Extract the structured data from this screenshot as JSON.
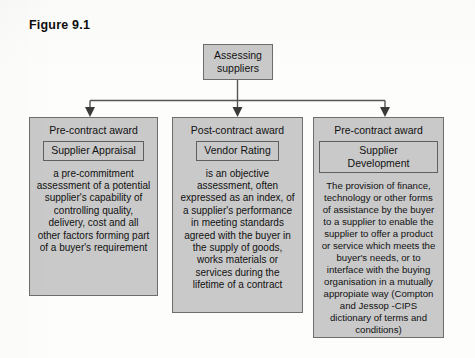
{
  "figure": {
    "title": "Figure 9.1"
  },
  "root": {
    "label": "Assessing suppliers"
  },
  "columns": [
    {
      "stage": "Pre-contract award",
      "term": "Supplier Appraisal",
      "body": "a pre-commitment assessment of a potential supplier's capability of controlling quality, delivery, cost and all other factors forming part of a buyer's requirement"
    },
    {
      "stage": "Post-contract award",
      "term": "Vendor Rating",
      "body": "is an objective assessment, often expressed as an index, of a supplier's performance in meeting standards agreed with the buyer in the supply of goods, works materials or services during the lifetime of a contract"
    },
    {
      "stage": "Pre-contract award",
      "term": "Supplier Development",
      "body": "The provision of finance, technology or other forms of assistance by the buyer to a supplier to enable the supplier to offer a product or service which meets the buyer's needs, or to interface with the buying organisation in a mutually appropiate way (Compton and Jessop -CIPS dictionary of terms and conditions)"
    }
  ],
  "style": {
    "box_fill": "#c9c9c9",
    "box_border": "#6d6d6d",
    "connector_color": "#555555",
    "text_color": "#111111",
    "page_background": "#fdfdfb"
  }
}
